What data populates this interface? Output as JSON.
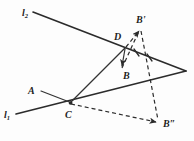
{
  "figure": {
    "background_color": "#fdfdfd",
    "stroke_color": "#2b2b2b",
    "width": 194,
    "height": 141
  },
  "labels": {
    "line1": "l",
    "line1_sub": "1",
    "line2": "l",
    "line2_sub": "2",
    "point_a": "A",
    "point_b": "B",
    "point_b_prime": "B'",
    "point_b_double_prime": "B″",
    "point_c": "C",
    "point_d": "D"
  },
  "geometry": {
    "points": {
      "l2_start": [
        33,
        12
      ],
      "D": [
        125,
        48
      ],
      "right_vertex": [
        186,
        71
      ],
      "C": [
        70,
        103
      ],
      "l1_start": [
        16,
        114
      ],
      "A_anchor": [
        40,
        91
      ],
      "B": [
        122,
        68
      ],
      "B_prime": [
        140,
        28
      ],
      "B_double_prime": [
        159,
        123
      ]
    },
    "segments": [
      {
        "name": "line-l2",
        "from": "l2_start",
        "to": "right_vertex",
        "style": "solid"
      },
      {
        "name": "line-l1",
        "from": "l1_start",
        "to": "right_vertex",
        "style": "solid"
      },
      {
        "name": "segment-A-C",
        "from": "A_anchor",
        "to": "C",
        "style": "thin"
      },
      {
        "name": "segment-C-D",
        "from": "C",
        "to": "D",
        "style": "thin"
      },
      {
        "name": "arrow-D-B",
        "from": "D",
        "to": "B",
        "style": "arrow"
      },
      {
        "name": "arrow-D-Bprime",
        "from": "D",
        "to": "B_prime",
        "style": "dashed-arrow"
      },
      {
        "name": "dashed-B-Bprime",
        "from": "B",
        "to": "B_prime",
        "style": "dashed"
      },
      {
        "name": "dashed-Bprime-Bdouble",
        "from": "B_prime",
        "to": "B_double_prime",
        "style": "dashed"
      },
      {
        "name": "dashed-C-Bdouble",
        "from": "C",
        "to": "B_double_prime",
        "style": "dashed-arrow"
      }
    ],
    "tick_marks": 2
  }
}
